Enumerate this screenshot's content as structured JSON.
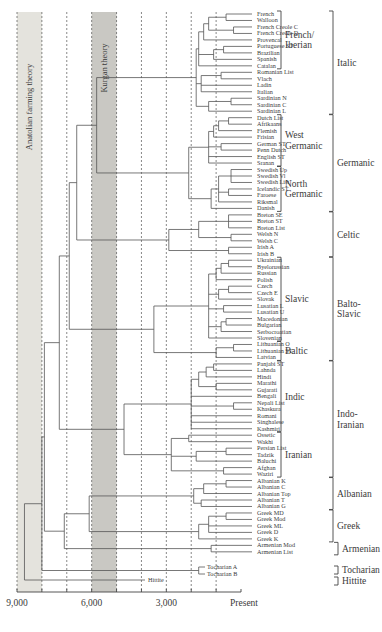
{
  "figure": {
    "type": "phylogenetic-tree",
    "caption_fragment": "",
    "bands": [
      {
        "label": "Anatolian farming theory",
        "from": 9000,
        "to": 8000,
        "color": "#e4e3dd"
      },
      {
        "label": "Kurgan theory",
        "from": 6000,
        "to": 5000,
        "color": "#c9c8c3"
      }
    ],
    "axis": {
      "ticks": [
        {
          "value": 9000,
          "label": "9,000"
        },
        {
          "value": 6000,
          "label": "6,000"
        },
        {
          "value": 3000,
          "label": "3,000"
        },
        {
          "value": 0,
          "label": "Present"
        }
      ],
      "gridlines": [
        9000,
        8000,
        7000,
        6000,
        5000,
        4000,
        3000,
        2000,
        1000
      ]
    },
    "leaves": [
      "French",
      "Walloon",
      "French Creole C",
      "French Creole D",
      "Provencal",
      "Portuguese ST",
      "Brazilian",
      "Spanish",
      "Catalan",
      "Romanian List",
      "Vlach",
      "Ladin",
      "Italian",
      "Sardinian N",
      "Sardinian C",
      "Sardinian L",
      "Dutch List",
      "Afrikaans",
      "Flemish",
      "Frisian",
      "German ST",
      "Penn Dutch",
      "English ST",
      "Sranan",
      "Swedish Up",
      "Swedish Vl",
      "Swedish List",
      "Icelandic ST",
      "Faroese",
      "Riksmal",
      "Danish",
      "Breton SE",
      "Breton ST",
      "Breton List",
      "Welsh N",
      "Welsh C",
      "Irish A",
      "Irish B",
      "Ukrainian",
      "Byelorussian",
      "Russian",
      "Polish",
      "Czech",
      "Czech E",
      "Slovak",
      "Lusatian L",
      "Lusatian U",
      "Macedonian",
      "Bulgarian",
      "Serbocroatian",
      "Slovenian",
      "Lithuanian O",
      "Lithuanian ST",
      "Latvian",
      "Panjabi ST",
      "Lahnda",
      "Hindi",
      "Marathi",
      "Gujarati",
      "Bengali",
      "Nepali List",
      "Khaskura",
      "Romani",
      "Singhalese",
      "Kashmiri",
      "Ossetic",
      "Wakhi",
      "Persian List",
      "Tadzik",
      "Baluchi",
      "Afghan",
      "Waziri",
      "Albanian K",
      "Albanian C",
      "Albanian Top",
      "Albanian T",
      "Albanian G",
      "Greek MD",
      "Greek Mod",
      "Greek ML",
      "Greek D",
      "Greek K",
      "Armenian Mod",
      "Armenian List"
    ],
    "outliers": [
      {
        "label": "Tocharian A"
      },
      {
        "label": "Tocharian B"
      },
      {
        "label": "Hittite"
      }
    ],
    "subgroups": [
      {
        "label": "French/\nIberian",
        "first": 0,
        "last": 8
      },
      {
        "label": "West\nGermanic",
        "first": 16,
        "last": 23
      },
      {
        "label": "North\nGermanic",
        "first": 24,
        "last": 30
      },
      {
        "label": "Slavic",
        "first": 38,
        "last": 50
      },
      {
        "label": "Baltic",
        "first": 51,
        "last": 53
      },
      {
        "label": "Indic",
        "first": 54,
        "last": 64
      },
      {
        "label": "Iranian",
        "first": 65,
        "last": 71
      }
    ],
    "families": [
      {
        "label": "Italic",
        "first": 0,
        "last": 15
      },
      {
        "label": "Germanic",
        "first": 16,
        "last": 30
      },
      {
        "label": "Celtic",
        "first": 31,
        "last": 37
      },
      {
        "label": "Balto-\nSlavic",
        "first": 38,
        "last": 53
      },
      {
        "label": "Indo-\nIranian",
        "first": 54,
        "last": 71
      },
      {
        "label": "Albanian",
        "first": 72,
        "last": 76
      },
      {
        "label": "Greek",
        "first": 77,
        "last": 81
      },
      {
        "label": "Armenian",
        "first": 82,
        "last": 83
      },
      {
        "label": "Tocharian",
        "outlier": "tocharian"
      },
      {
        "label": "Hittite",
        "outlier": "hittite"
      }
    ]
  }
}
